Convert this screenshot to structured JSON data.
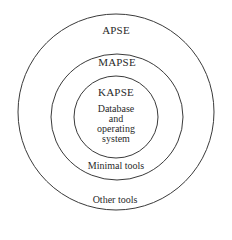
{
  "diagram": {
    "stroke_color": "#3a3a3a",
    "background": "#ffffff",
    "rings": [
      {
        "name": "APSE",
        "layer_content": "Other tools",
        "cx": 116,
        "cy": 112,
        "rx": 98,
        "ry": 98
      },
      {
        "name": "MAPSE",
        "layer_content": "Minimal tools",
        "cx": 117,
        "cy": 117,
        "rx": 66,
        "ry": 63
      },
      {
        "name": "KAPSE",
        "layer_content": "Database and operating system",
        "cx": 116,
        "cy": 117,
        "rx": 42,
        "ry": 41
      }
    ]
  },
  "labels": {
    "apse": "APSE",
    "mapse": "MAPSE",
    "kapse": "KAPSE",
    "core_line1": "Database",
    "core_line2": "and",
    "core_line3": "operating",
    "core_line4": "system",
    "minimal_tools": "Minimal tools",
    "other_tools": "Other tools"
  }
}
